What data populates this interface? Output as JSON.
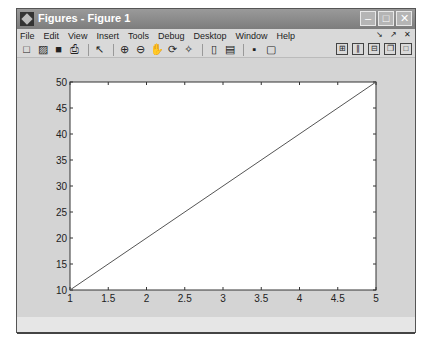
{
  "window": {
    "title": "Figures - Figure 1",
    "controls": {
      "minimize": "–",
      "maximize": "□",
      "close": "✕"
    }
  },
  "menu": {
    "items": [
      "File",
      "Edit",
      "View",
      "Insert",
      "Tools",
      "Debug",
      "Desktop",
      "Window",
      "Help"
    ],
    "dock_controls": [
      "↘",
      "↗",
      "✕"
    ]
  },
  "toolbar": {
    "left": [
      {
        "name": "new-figure-icon",
        "glyph": "□"
      },
      {
        "name": "open-icon",
        "glyph": "▨"
      },
      {
        "name": "save-icon",
        "glyph": "■"
      },
      {
        "name": "print-icon",
        "glyph": "⎙"
      },
      {
        "name": "edit-plot-arrow-icon",
        "glyph": "↖"
      },
      {
        "name": "zoom-in-icon",
        "glyph": "⊕"
      },
      {
        "name": "zoom-out-icon",
        "glyph": "⊖"
      },
      {
        "name": "pan-hand-icon",
        "glyph": "✋"
      },
      {
        "name": "rotate-3d-icon",
        "glyph": "⟳"
      },
      {
        "name": "data-cursor-icon",
        "glyph": "✧"
      },
      {
        "name": "insert-colorbar-icon",
        "glyph": "▯"
      },
      {
        "name": "insert-legend-icon",
        "glyph": "▤"
      },
      {
        "name": "hide-plot-tools-icon",
        "glyph": "▪"
      },
      {
        "name": "show-plot-tools-icon",
        "glyph": "▢"
      }
    ],
    "layout": [
      {
        "name": "tile-grid-icon",
        "glyph": "⊞"
      },
      {
        "name": "tile-columns-icon",
        "glyph": "∥"
      },
      {
        "name": "tile-rows-icon",
        "glyph": "⊟"
      },
      {
        "name": "float-icon",
        "glyph": "❐"
      },
      {
        "name": "maximize-doc-icon",
        "glyph": "□"
      }
    ]
  },
  "chart_data": {
    "type": "line",
    "title": "",
    "xlabel": "",
    "ylabel": "",
    "x": [
      1,
      5
    ],
    "series": [
      {
        "name": "line",
        "values": [
          10,
          50
        ],
        "color": "#555555"
      }
    ],
    "xlim": [
      1,
      5
    ],
    "ylim": [
      10,
      50
    ],
    "xticks": [
      "1",
      "1.5",
      "2",
      "2.5",
      "3",
      "3.5",
      "4",
      "4.5",
      "5"
    ],
    "yticks": [
      "10",
      "15",
      "20",
      "25",
      "30",
      "35",
      "40",
      "45",
      "50"
    ],
    "grid": false,
    "legend": null
  }
}
